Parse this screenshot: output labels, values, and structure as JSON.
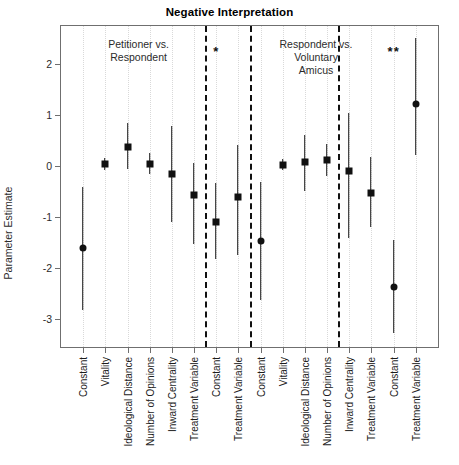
{
  "chart_data": {
    "type": "scatter",
    "title": "Negative Interpretation",
    "xlabel": "",
    "ylabel": "Parameter Estimate",
    "ylim": [
      -3.55,
      2.75
    ],
    "yticks": [
      2,
      1,
      0,
      -1,
      -2,
      -3
    ],
    "ytick_labels": [
      "2",
      "1",
      "0",
      "-1",
      "-2",
      "-3"
    ],
    "grid": "vertical dotted category guides",
    "legend": "none",
    "panel_separators_after_category_index": [
      6,
      8,
      12
    ],
    "categories": [
      "Constant",
      "Vitality",
      "Ideological Distance",
      "Number of Opinions",
      "Inward Centrality",
      "Treatment Variable",
      "Constant",
      "Treatment Variable",
      "Constant",
      "Vitality",
      "Ideological Distance",
      "Number of Opinions",
      "Inward Centrality",
      "Treatment Variable",
      "Constant",
      "Treatment Variable"
    ],
    "points": [
      {
        "label": "Constant",
        "estimate": -1.6,
        "low": -2.82,
        "high": -0.4,
        "marker": "circle"
      },
      {
        "label": "Vitality",
        "estimate": 0.04,
        "low": -0.08,
        "high": 0.16,
        "marker": "square"
      },
      {
        "label": "Ideological Distance",
        "estimate": 0.38,
        "low": -0.06,
        "high": 0.84,
        "marker": "square"
      },
      {
        "label": "Number of Opinions",
        "estimate": 0.05,
        "low": -0.16,
        "high": 0.26,
        "marker": "square"
      },
      {
        "label": "Inward Centrality",
        "estimate": -0.16,
        "low": -1.1,
        "high": 0.79,
        "marker": "square"
      },
      {
        "label": "Treatment Variable",
        "estimate": -0.57,
        "low": -1.53,
        "high": 0.06,
        "marker": "square"
      },
      {
        "label": "Constant",
        "estimate": -1.09,
        "low": -1.83,
        "high": -0.33,
        "marker": "square"
      },
      {
        "label": "Treatment Variable",
        "estimate": -0.6,
        "low": -1.75,
        "high": 0.42,
        "marker": "square"
      },
      {
        "label": "Constant",
        "estimate": -1.47,
        "low": -2.62,
        "high": -0.32,
        "marker": "circle"
      },
      {
        "label": "Vitality",
        "estimate": 0.03,
        "low": -0.07,
        "high": 0.13,
        "marker": "square"
      },
      {
        "label": "Ideological Distance",
        "estimate": 0.08,
        "low": -0.48,
        "high": 0.62,
        "marker": "square"
      },
      {
        "label": "Number of Opinions",
        "estimate": 0.12,
        "low": -0.2,
        "high": 0.44,
        "marker": "square"
      },
      {
        "label": "Inward Centrality",
        "estimate": -0.1,
        "low": -1.42,
        "high": 1.04,
        "marker": "square"
      },
      {
        "label": "Treatment Variable",
        "estimate": -0.53,
        "low": -1.2,
        "high": 0.18,
        "marker": "square"
      },
      {
        "label": "Constant",
        "estimate": -2.38,
        "low": -3.28,
        "high": -1.45,
        "marker": "circle"
      },
      {
        "label": "Treatment Variable",
        "estimate": 1.21,
        "low": 0.22,
        "high": 2.52,
        "marker": "circle"
      }
    ],
    "annotations": [
      {
        "id": "panel-note-left",
        "text": "Petitioner vs.\nRespondent",
        "lines": [
          "Petitioner vs.",
          "Respondent"
        ]
      },
      {
        "id": "panel-note-right",
        "text": "Respondent vs.\nVoluntary\nAmicus",
        "lines": [
          "Respondent vs.",
          "Voluntary",
          "Amicus"
        ]
      },
      {
        "id": "sig-marker-1",
        "text": "*",
        "after_category_index": 6
      },
      {
        "id": "sig-marker-2",
        "text": "**",
        "after_category_index": 14
      }
    ]
  },
  "colors": {
    "point": "#111111",
    "interval": "#1a1a1a",
    "frame": "#6f6f6f",
    "guide": "#d9d9d9",
    "separator": "#111111",
    "text": "#1c1c1c",
    "background": "#ffffff"
  }
}
